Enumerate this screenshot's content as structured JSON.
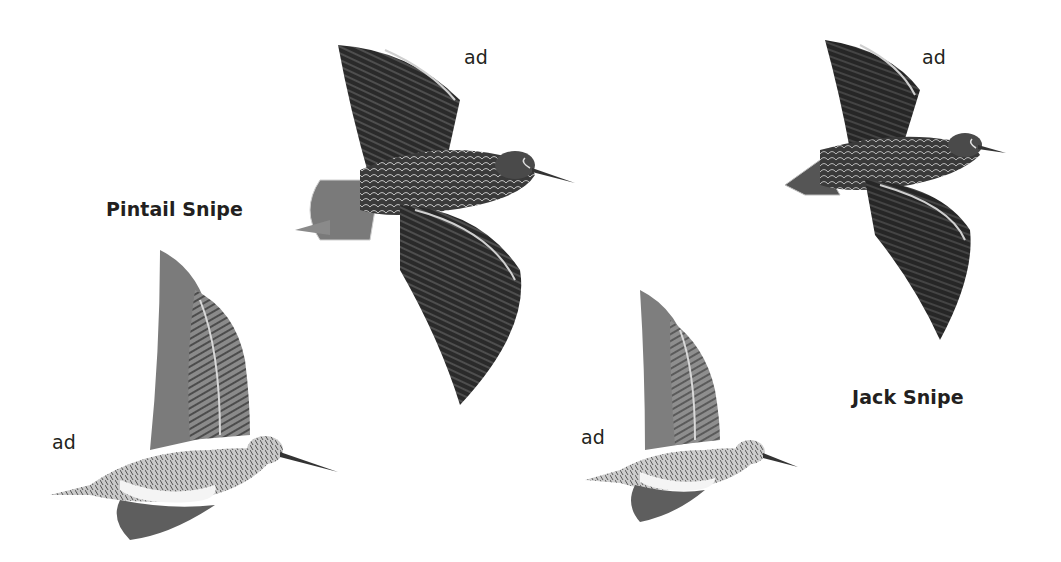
{
  "plate": {
    "species": [
      {
        "name": "Pintail Snipe",
        "figures": [
          {
            "pose": "flight-upperside",
            "age_label": "ad"
          },
          {
            "pose": "flight-underside",
            "age_label": "ad"
          }
        ]
      },
      {
        "name": "Jack Snipe",
        "figures": [
          {
            "pose": "flight-upperside",
            "age_label": "ad"
          },
          {
            "pose": "flight-underside",
            "age_label": "ad"
          }
        ]
      }
    ]
  },
  "colors": {
    "background": "#ffffff",
    "text": "#231f20",
    "plumage_dark": "#2b2b2b",
    "plumage_mid": "#6e6e6e",
    "plumage_light": "#bdbdbd",
    "belly": "#f4f4f4"
  }
}
